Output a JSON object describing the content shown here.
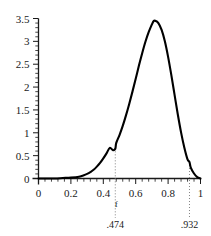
{
  "chart_data": {
    "type": "line",
    "title": "",
    "subtitle": "",
    "xlabel": "",
    "ylabel": "",
    "xlim": [
      0,
      1
    ],
    "ylim": [
      0,
      3.5
    ],
    "grid": false,
    "legend": "none",
    "x_ticks": [
      "0",
      "0.2",
      "0.4",
      "0.6",
      "0.8",
      "1"
    ],
    "x_tick_values": [
      0,
      0.2,
      0.4,
      0.6,
      0.8,
      1
    ],
    "x_minor_step": 0.04,
    "y_ticks": [
      "0",
      "0.5",
      "1",
      "1.5",
      "2",
      "2.5",
      "3",
      "3.5"
    ],
    "y_tick_values": [
      0,
      0.5,
      1,
      1.5,
      2,
      2.5,
      3,
      3.5
    ],
    "y_minor_step": 0.1,
    "series": [
      {
        "name": "density",
        "x": [
          0.0,
          0.05,
          0.1,
          0.15,
          0.2,
          0.25,
          0.28,
          0.3,
          0.32,
          0.34,
          0.36,
          0.38,
          0.4,
          0.42,
          0.44,
          0.46,
          0.474,
          0.48,
          0.5,
          0.52,
          0.54,
          0.56,
          0.58,
          0.6,
          0.62,
          0.64,
          0.66,
          0.68,
          0.7,
          0.71,
          0.72,
          0.74,
          0.76,
          0.78,
          0.8,
          0.82,
          0.84,
          0.86,
          0.88,
          0.9,
          0.92,
          0.932,
          0.94,
          0.96,
          0.98,
          1.0
        ],
        "y": [
          0.0,
          0.0,
          0.0,
          0.01,
          0.02,
          0.04,
          0.07,
          0.1,
          0.14,
          0.19,
          0.26,
          0.34,
          0.44,
          0.55,
          0.67,
          0.62,
          0.65,
          0.78,
          0.95,
          1.15,
          1.38,
          1.63,
          1.9,
          2.18,
          2.47,
          2.74,
          2.99,
          3.2,
          3.37,
          3.44,
          3.45,
          3.4,
          3.25,
          3.0,
          2.66,
          2.26,
          1.83,
          1.4,
          1.01,
          0.68,
          0.42,
          0.36,
          0.24,
          0.11,
          0.03,
          0.0
        ],
        "color": "#000000"
      }
    ],
    "annotations": [
      {
        "name": "f-marker",
        "x": 0.474,
        "label": "f",
        "value_label": ".474",
        "line_style": "dotted",
        "line_top_value": 0.66,
        "color": "#808080"
      },
      {
        "name": "upper-marker",
        "x": 0.932,
        "label": "",
        "value_label": ".932",
        "line_style": "dotted",
        "line_top_value": 0.36,
        "color": "#808080"
      }
    ],
    "axis_color": "#1a1a1a",
    "curve_color": "#000000",
    "background": "#ffffff"
  }
}
